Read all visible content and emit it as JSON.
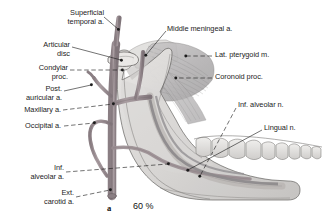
{
  "figure": {
    "panel_letter": "a",
    "scale": "60 %",
    "background_color": "#ffffff",
    "ink_color": "#1c1c1c",
    "artery_color": "#9a8e92",
    "bone_color": "#d8d6d4",
    "muscle_color": "#b9b7b8",
    "nerve_color": "#8d8a8c"
  },
  "labels": {
    "superficial_temporal": "Superficial\ntemporal a.",
    "articular_disc": "Articular\ndisc",
    "condylar_proc": "Condylar\nproc.",
    "post_auricular": "Post.\nauricular a.",
    "maxillary": "Maxillary a.",
    "occipital": "Occipital a.",
    "inf_alveolar_a": "Inf.\nalveolar a.",
    "ext_carotid": "Ext.\ncarotid a.",
    "middle_meningeal": "Middle meningeal a.",
    "lat_pterygoid": "Lat. pterygoid m.",
    "coronoid_proc": "Coronoid proc.",
    "inf_alveolar_n": "Inf. alveolar n.",
    "lingual_n": "Lingual n."
  }
}
